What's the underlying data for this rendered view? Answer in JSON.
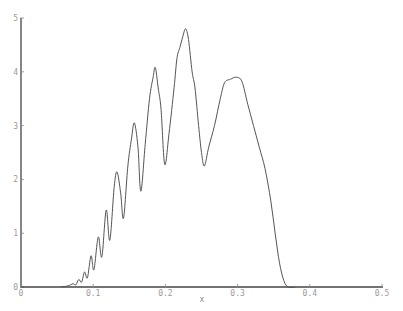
{
  "chart_data": {
    "type": "line",
    "title": "",
    "xlabel": "x",
    "ylabel": "",
    "xlim": [
      0,
      0.5
    ],
    "ylim": [
      0,
      5
    ],
    "grid": false,
    "legend": null,
    "x_ticks": [
      "0",
      "0.1",
      "0.2",
      "0.3",
      "0.4",
      "0.5"
    ],
    "y_ticks": [
      "0",
      "1",
      "2",
      "3",
      "4",
      "5"
    ],
    "series": [
      {
        "name": "curve",
        "color": "#555555",
        "points": [
          [
            0.055,
            0.0
          ],
          [
            0.065,
            0.02
          ],
          [
            0.072,
            0.06
          ],
          [
            0.076,
            0.04
          ],
          [
            0.08,
            0.14
          ],
          [
            0.084,
            0.09
          ],
          [
            0.088,
            0.28
          ],
          [
            0.092,
            0.17
          ],
          [
            0.097,
            0.58
          ],
          [
            0.101,
            0.32
          ],
          [
            0.107,
            0.93
          ],
          [
            0.112,
            0.56
          ],
          [
            0.118,
            1.43
          ],
          [
            0.123,
            0.87
          ],
          [
            0.129,
            1.85
          ],
          [
            0.133,
            2.14
          ],
          [
            0.138,
            1.75
          ],
          [
            0.142,
            1.28
          ],
          [
            0.148,
            2.25
          ],
          [
            0.153,
            2.75
          ],
          [
            0.157,
            3.05
          ],
          [
            0.162,
            2.6
          ],
          [
            0.166,
            1.78
          ],
          [
            0.172,
            2.65
          ],
          [
            0.178,
            3.5
          ],
          [
            0.183,
            3.9
          ],
          [
            0.186,
            4.08
          ],
          [
            0.19,
            3.7
          ],
          [
            0.194,
            3.3
          ],
          [
            0.199,
            2.28
          ],
          [
            0.205,
            2.85
          ],
          [
            0.212,
            3.7
          ],
          [
            0.216,
            4.25
          ],
          [
            0.22,
            4.45
          ],
          [
            0.224,
            4.65
          ],
          [
            0.228,
            4.8
          ],
          [
            0.232,
            4.6
          ],
          [
            0.237,
            4.0
          ],
          [
            0.241,
            3.7
          ],
          [
            0.246,
            3.0
          ],
          [
            0.25,
            2.5
          ],
          [
            0.254,
            2.25
          ],
          [
            0.26,
            2.6
          ],
          [
            0.268,
            3.0
          ],
          [
            0.276,
            3.5
          ],
          [
            0.282,
            3.8
          ],
          [
            0.29,
            3.86
          ],
          [
            0.298,
            3.9
          ],
          [
            0.306,
            3.82
          ],
          [
            0.314,
            3.4
          ],
          [
            0.322,
            3.0
          ],
          [
            0.33,
            2.6
          ],
          [
            0.338,
            2.2
          ],
          [
            0.346,
            1.6
          ],
          [
            0.352,
            1.0
          ],
          [
            0.358,
            0.45
          ],
          [
            0.364,
            0.12
          ],
          [
            0.37,
            0.0
          ],
          [
            0.38,
            0.0
          ]
        ]
      }
    ]
  }
}
